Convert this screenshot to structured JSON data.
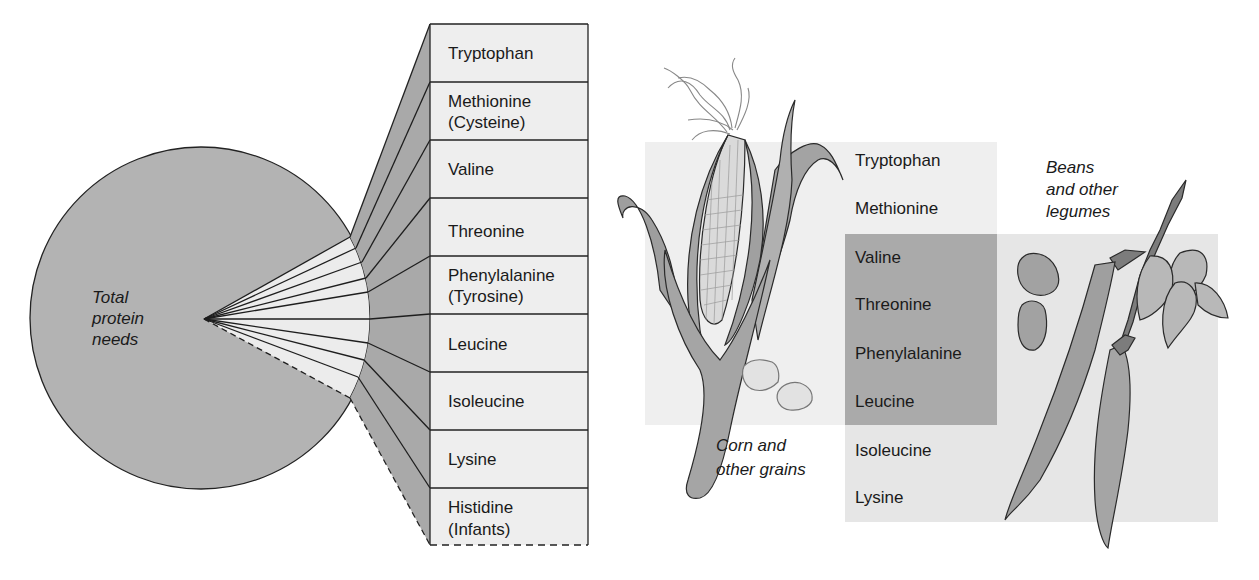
{
  "left_panel": {
    "circle_label": [
      "Total",
      "protein",
      "needs"
    ],
    "amino_acids": [
      {
        "lines": [
          "Tryptophan"
        ]
      },
      {
        "lines": [
          "Methionine",
          "(Cysteine)"
        ]
      },
      {
        "lines": [
          "Valine"
        ]
      },
      {
        "lines": [
          "Threonine"
        ]
      },
      {
        "lines": [
          "Phenylalanine",
          "(Tyrosine)"
        ]
      },
      {
        "lines": [
          "Leucine"
        ]
      },
      {
        "lines": [
          "Isoleucine"
        ]
      },
      {
        "lines": [
          "Lysine"
        ]
      },
      {
        "lines": [
          "Histidine",
          "(Infants)"
        ]
      }
    ]
  },
  "right_panel": {
    "corn_label": [
      "Corn and",
      "other grains"
    ],
    "beans_label": [
      "Beans",
      "and other",
      "legumes"
    ],
    "amino_acids": [
      "Tryptophan",
      "Methionine",
      "Valine",
      "Threonine",
      "Phenylalanine",
      "Leucine",
      "Isoleucine",
      "Lysine"
    ],
    "corn_provides": [
      "Tryptophan",
      "Methionine",
      "Valine",
      "Threonine",
      "Phenylalanine",
      "Leucine"
    ],
    "beans_provides": [
      "Valine",
      "Threonine",
      "Phenylalanine",
      "Leucine",
      "Isoleucine",
      "Lysine"
    ]
  },
  "colors": {
    "circle_fill": "#b3b3b3",
    "wedge_fill": "#ececec",
    "fan_fill": "#a9a9a9",
    "table_fill": "#eeeeee",
    "corn_box": "#efefef",
    "beans_box": "#e6e6e6",
    "overlap_box": "#aaaaaa",
    "line": "#1e1e1e"
  }
}
